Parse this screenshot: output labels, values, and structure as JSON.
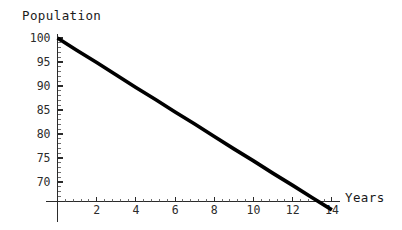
{
  "chart_data": {
    "type": "line",
    "title": "",
    "xlabel": "Years",
    "ylabel": "Population",
    "xlim": [
      0,
      15
    ],
    "ylim": [
      66,
      101
    ],
    "grid": false,
    "legend": null,
    "xticks": [
      2,
      4,
      6,
      8,
      10,
      12,
      14
    ],
    "yticks": [
      70,
      75,
      80,
      85,
      90,
      95,
      100
    ],
    "xtick_labels": [
      "2",
      "4",
      "6",
      "8",
      "10",
      "12",
      "14"
    ],
    "ytick_labels": [
      "70",
      "75",
      "80",
      "85",
      "90",
      "95",
      "100"
    ],
    "x_minor_step": 0.4,
    "y_minor_step": 1,
    "series": [
      {
        "name": "Population",
        "color": "#000000",
        "x": [
          0,
          1,
          2,
          3,
          4,
          5,
          6,
          7,
          8,
          9,
          10,
          11,
          12,
          13,
          14
        ],
        "values": [
          100.0,
          97.4,
          94.9,
          92.3,
          89.7,
          87.2,
          84.6,
          82.1,
          79.5,
          76.9,
          74.4,
          71.8,
          69.3,
          66.7,
          64.2
        ]
      }
    ],
    "annotations": [
      {
        "text": "Population",
        "role": "y-axis-label",
        "position": "top-left"
      },
      {
        "text": "Years",
        "role": "x-axis-label",
        "position": "right-of-x-axis"
      }
    ]
  },
  "axis": {
    "y_label": "Population",
    "x_label": "Years"
  },
  "ticks": {
    "y": [
      "100",
      "95",
      "90",
      "85",
      "80",
      "75",
      "70"
    ],
    "x": [
      "2",
      "4",
      "6",
      "8",
      "10",
      "12",
      "14"
    ]
  },
  "colors": {
    "line": "#000000",
    "axis": "#2b2b2b",
    "background": "#ffffff",
    "text": "#1a1a1a"
  }
}
